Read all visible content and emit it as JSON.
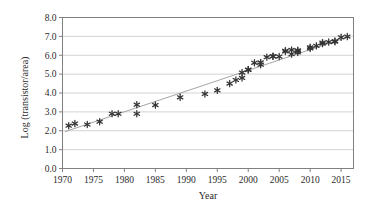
{
  "chart_data": {
    "type": "scatter",
    "title": "",
    "xlabel": "Year",
    "ylabel": "Log (transistor/area)",
    "xlim": [
      1970,
      2017
    ],
    "ylim": [
      0.0,
      8.0
    ],
    "grid": true,
    "legend": null,
    "xticks": [
      1970,
      1975,
      1980,
      1985,
      1990,
      1995,
      2000,
      2005,
      2010,
      2015
    ],
    "xtick_labels": [
      "1970",
      "1975",
      "1980",
      "1985",
      "1990",
      "1995",
      "2000",
      "2005",
      "2010",
      "2015"
    ],
    "yticks": [
      0.0,
      1.0,
      2.0,
      3.0,
      4.0,
      5.0,
      6.0,
      7.0,
      8.0
    ],
    "ytick_labels": [
      "0.0",
      "1.0",
      "2.0",
      "3.0",
      "4.0",
      "5.0",
      "6.0",
      "7.0",
      "8.0"
    ],
    "marker": "asterisk",
    "marker_color": "#333333",
    "trendline": {
      "color": "#9a9a9a",
      "x": [
        1970.4,
        2016.4
      ],
      "y": [
        1.95,
        7.0
      ]
    },
    "points": [
      {
        "x": 1971,
        "y": 2.27
      },
      {
        "x": 1972,
        "y": 2.38
      },
      {
        "x": 1974,
        "y": 2.33
      },
      {
        "x": 1976,
        "y": 2.48
      },
      {
        "x": 1978,
        "y": 2.9
      },
      {
        "x": 1979,
        "y": 2.9
      },
      {
        "x": 1982,
        "y": 3.38
      },
      {
        "x": 1982,
        "y": 2.9
      },
      {
        "x": 1985,
        "y": 3.36
      },
      {
        "x": 1989,
        "y": 3.77
      },
      {
        "x": 1993,
        "y": 3.95
      },
      {
        "x": 1995,
        "y": 4.14
      },
      {
        "x": 1997,
        "y": 4.5
      },
      {
        "x": 1998,
        "y": 4.69
      },
      {
        "x": 1999,
        "y": 5.08
      },
      {
        "x": 1999,
        "y": 4.8
      },
      {
        "x": 2000,
        "y": 5.22
      },
      {
        "x": 2000,
        "y": 5.24
      },
      {
        "x": 2001,
        "y": 5.6
      },
      {
        "x": 2002,
        "y": 5.62
      },
      {
        "x": 2002,
        "y": 5.5
      },
      {
        "x": 2003,
        "y": 5.9
      },
      {
        "x": 2004,
        "y": 5.94
      },
      {
        "x": 2004,
        "y": 5.95
      },
      {
        "x": 2005,
        "y": 5.93
      },
      {
        "x": 2006,
        "y": 6.2
      },
      {
        "x": 2006,
        "y": 6.24
      },
      {
        "x": 2007,
        "y": 6.28
      },
      {
        "x": 2007,
        "y": 6.06
      },
      {
        "x": 2008,
        "y": 6.26
      },
      {
        "x": 2008,
        "y": 6.22
      },
      {
        "x": 2008,
        "y": 6.15
      },
      {
        "x": 2010,
        "y": 6.36
      },
      {
        "x": 2010,
        "y": 6.42
      },
      {
        "x": 2011,
        "y": 6.5
      },
      {
        "x": 2012,
        "y": 6.62
      },
      {
        "x": 2012,
        "y": 6.67
      },
      {
        "x": 2013,
        "y": 6.7
      },
      {
        "x": 2014,
        "y": 6.72
      },
      {
        "x": 2014,
        "y": 6.75
      },
      {
        "x": 2015,
        "y": 6.95
      },
      {
        "x": 2016,
        "y": 6.99
      }
    ]
  },
  "figure": {
    "background_color": "#ffffff",
    "frame_color": "#808080",
    "gridline_color": "#c8c8c8"
  }
}
